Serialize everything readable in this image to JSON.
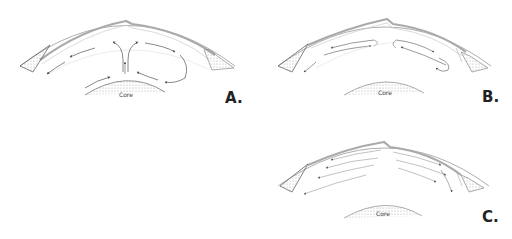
{
  "diagram": {
    "colors": {
      "line": "#8a8a8a",
      "crust_band": "#b5b5b5",
      "stipple": "#9a9a9a",
      "arrow": "#555555",
      "text": "#222222"
    },
    "panels": [
      {
        "id": "A",
        "letter": "A.",
        "core_label": "Core",
        "flow_pattern": "rising plume at ridge splitting into two cells; right cell closes in a loop down to the core"
      },
      {
        "id": "B",
        "letter": "B.",
        "core_label": "Core",
        "flow_pattern": "two shallow closed cells diverging from ridge, not reaching core"
      },
      {
        "id": "C",
        "letter": "C.",
        "core_label": "Core",
        "flow_pattern": "parallel layered flow lines diverging from ridge toward continents"
      }
    ]
  }
}
